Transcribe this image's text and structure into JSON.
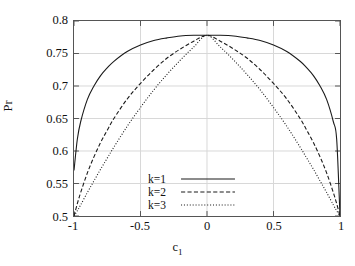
{
  "figure": {
    "background": "#ffffff",
    "frame_color": "#555555",
    "grid_color": "#d8d8d8",
    "line_color": "#1a1a1a"
  },
  "axes": {
    "ylabel": "Pr",
    "xlabel_base": "c",
    "xlabel_sub": "1",
    "ytick_labels": [
      "0.5",
      "0.55",
      "0.6",
      "0.65",
      "0.7",
      "0.75",
      "0.8"
    ],
    "xtick_labels": [
      "-1",
      "-0.5",
      "0",
      "0.5",
      "1"
    ]
  },
  "legend": {
    "entries": [
      {
        "label": "k=1",
        "style": "solid"
      },
      {
        "label": "k=2",
        "style": "dashed"
      },
      {
        "label": "k=3",
        "style": "dotted"
      }
    ]
  },
  "chart_data": {
    "type": "line",
    "title": "",
    "xlabel": "c_1",
    "ylabel": "Pr",
    "xlim": [
      -1,
      1
    ],
    "ylim": [
      0.5,
      0.8
    ],
    "xticks": [
      -1,
      -0.5,
      0,
      0.5,
      1
    ],
    "yticks": [
      0.5,
      0.55,
      0.6,
      0.65,
      0.7,
      0.75,
      0.8
    ],
    "grid": true,
    "legend_position": "inside lower center",
    "peak_value": 0.778,
    "peak_x": 0,
    "series": [
      {
        "name": "k=1",
        "style": "solid",
        "x": [
          -1.0,
          -0.975,
          -0.95,
          -0.9,
          -0.85,
          -0.8,
          -0.75,
          -0.7,
          -0.6,
          -0.5,
          -0.4,
          -0.3,
          -0.2,
          -0.1,
          0.0,
          0.1,
          0.2,
          0.3,
          0.4,
          0.5,
          0.6,
          0.7,
          0.75,
          0.8,
          0.85,
          0.9,
          0.95,
          0.975,
          1.0
        ],
        "y": [
          0.57,
          0.618,
          0.645,
          0.679,
          0.7,
          0.716,
          0.728,
          0.738,
          0.753,
          0.763,
          0.77,
          0.774,
          0.777,
          0.778,
          0.778,
          0.778,
          0.777,
          0.774,
          0.77,
          0.763,
          0.753,
          0.738,
          0.728,
          0.716,
          0.7,
          0.679,
          0.645,
          0.618,
          0.5
        ]
      },
      {
        "name": "k=2",
        "style": "dashed",
        "x": [
          -1.0,
          -0.975,
          -0.95,
          -0.9,
          -0.85,
          -0.8,
          -0.75,
          -0.7,
          -0.6,
          -0.5,
          -0.4,
          -0.3,
          -0.2,
          -0.1,
          0.0,
          0.1,
          0.2,
          0.3,
          0.4,
          0.5,
          0.6,
          0.7,
          0.75,
          0.8,
          0.85,
          0.9,
          0.95,
          0.975,
          1.0
        ],
        "y": [
          0.5,
          0.519,
          0.536,
          0.566,
          0.591,
          0.613,
          0.632,
          0.65,
          0.68,
          0.704,
          0.725,
          0.743,
          0.757,
          0.769,
          0.778,
          0.769,
          0.757,
          0.743,
          0.725,
          0.704,
          0.68,
          0.65,
          0.632,
          0.613,
          0.591,
          0.566,
          0.536,
          0.519,
          0.5
        ]
      },
      {
        "name": "k=3",
        "style": "dotted",
        "x": [
          -1.0,
          -0.975,
          -0.95,
          -0.9,
          -0.85,
          -0.8,
          -0.75,
          -0.7,
          -0.6,
          -0.5,
          -0.4,
          -0.3,
          -0.2,
          -0.1,
          0.0,
          0.1,
          0.2,
          0.3,
          0.4,
          0.5,
          0.6,
          0.7,
          0.75,
          0.8,
          0.85,
          0.9,
          0.95,
          0.975,
          1.0
        ],
        "y": [
          0.5,
          0.508,
          0.517,
          0.536,
          0.554,
          0.572,
          0.589,
          0.606,
          0.638,
          0.667,
          0.694,
          0.718,
          0.74,
          0.76,
          0.778,
          0.76,
          0.74,
          0.718,
          0.694,
          0.667,
          0.638,
          0.606,
          0.589,
          0.572,
          0.554,
          0.536,
          0.517,
          0.508,
          0.5
        ]
      }
    ]
  }
}
